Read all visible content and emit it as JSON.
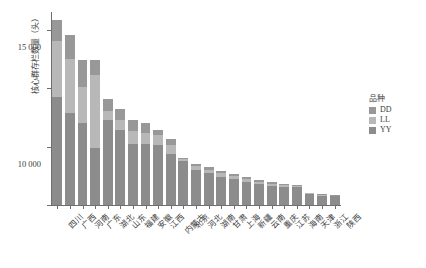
{
  "chart_data": {
    "type": "bar",
    "subtype": "stacked-bar",
    "title": "",
    "xlabel": "",
    "ylabel": "核心群存栏数量（头）",
    "ylim": [
      0,
      16500
    ],
    "grid": false,
    "legend_position": "right",
    "y_ticks": [
      {
        "value": 0,
        "label": "0"
      },
      {
        "value": 5000,
        "label": "5 000"
      },
      {
        "value": 10000,
        "label": "10 000"
      },
      {
        "value": 15000,
        "label": "15 000"
      }
    ],
    "categories": [
      "四川",
      "广西",
      "河南",
      "广东",
      "湖北",
      "山东",
      "福建",
      "安徽",
      "江西",
      "内蒙古",
      "北京",
      "河北",
      "湖南",
      "甘肃",
      "上海",
      "新疆",
      "云南",
      "重庆",
      "江苏",
      "海南",
      "天津",
      "浙江",
      "陕西"
    ],
    "series": [
      {
        "name": "YY",
        "color": "#8c8c8c",
        "values": [
          9200,
          7900,
          7000,
          4900,
          7300,
          6400,
          5200,
          5200,
          5100,
          4400,
          3800,
          3000,
          2700,
          2400,
          2200,
          2000,
          1800,
          1650,
          1550,
          1500,
          900,
          800,
          750
        ]
      },
      {
        "name": "LL",
        "color": "#b8b8b8",
        "values": [
          4800,
          4600,
          3100,
          6200,
          700,
          900,
          1100,
          1000,
          900,
          700,
          150,
          300,
          300,
          300,
          250,
          200,
          200,
          150,
          150,
          100,
          90,
          60,
          60
        ]
      },
      {
        "name": "DD",
        "color": "#989898",
        "values": [
          1800,
          2000,
          2300,
          1300,
          1100,
          900,
          1000,
          800,
          450,
          550,
          100,
          250,
          250,
          250,
          200,
          180,
          150,
          130,
          130,
          80,
          60,
          50,
          40
        ]
      }
    ],
    "totals": [
      15800,
      14500,
      12400,
      12400,
      9100,
      8200,
      7300,
      7000,
      6450,
      5650,
      4050,
      3550,
      3250,
      2950,
      2650,
      2380,
      2150,
      1930,
      1830,
      1680,
      1050,
      910,
      850
    ]
  },
  "legend": {
    "title": "品种",
    "items": [
      {
        "label": "DD",
        "color": "#989898"
      },
      {
        "label": "LL",
        "color": "#b8b8b8"
      },
      {
        "label": "YY",
        "color": "#8c8c8c"
      }
    ]
  }
}
